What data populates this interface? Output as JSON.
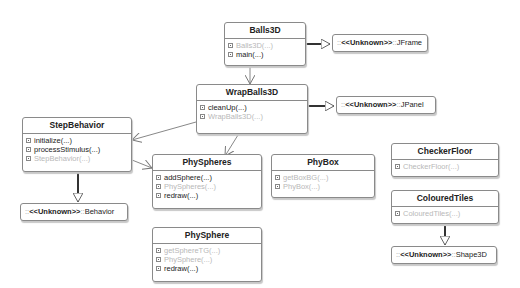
{
  "classes": {
    "balls3d": {
      "name": "Balls3D",
      "ops": [
        {
          "label": "Balls3D(...)",
          "ctor": true
        },
        {
          "label": "main(...)",
          "ctor": false
        }
      ]
    },
    "wrapballs3d": {
      "name": "WrapBalls3D",
      "ops": [
        {
          "label": "cleanUp(...)",
          "ctor": false
        },
        {
          "label": "WrapBalls3D(...)",
          "ctor": true
        }
      ]
    },
    "stepbehavior": {
      "name": "StepBehavior",
      "ops": [
        {
          "label": "initialize(...)",
          "ctor": false
        },
        {
          "label": "processStimulus(...)",
          "ctor": false
        },
        {
          "label": "StepBehavior(...)",
          "ctor": true
        }
      ]
    },
    "physpheres": {
      "name": "PhySpheres",
      "ops": [
        {
          "label": "addSphere(...)",
          "ctor": false
        },
        {
          "label": "PhySpheres(...)",
          "ctor": true
        },
        {
          "label": "redraw(...)",
          "ctor": false
        }
      ]
    },
    "phybox": {
      "name": "PhyBox",
      "ops": [
        {
          "label": "getBoxBG(...)",
          "ctor": true
        },
        {
          "label": "PhyBox(...)",
          "ctor": true
        }
      ]
    },
    "checkerfloor": {
      "name": "CheckerFloor",
      "ops": [
        {
          "label": "CheckerFloor(...)",
          "ctor": true
        }
      ]
    },
    "colouredtiles": {
      "name": "ColouredTiles",
      "ops": [
        {
          "label": "ColouredTiles(...)",
          "ctor": true
        }
      ]
    },
    "physphere": {
      "name": "PhySphere",
      "ops": [
        {
          "label": "getSphereTG(...)",
          "ctor": true
        },
        {
          "label": "PhySphere(...)",
          "ctor": true
        },
        {
          "label": "redraw(...)",
          "ctor": false
        }
      ]
    }
  },
  "external": {
    "prefix": "::",
    "stereotype": "<<Unknown>>",
    "sep": "::",
    "jframe": "JFrame",
    "jpanel": "JPanel",
    "behavior": "Behavior",
    "shape3d": "Shape3D"
  },
  "colors": {
    "border": "#8a8a8a",
    "line": "#555555",
    "ctor_text": "#b8b8b8"
  }
}
